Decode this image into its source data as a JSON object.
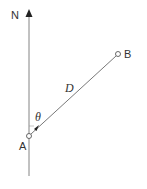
{
  "diagram": {
    "type": "bearing-diagram",
    "north_label": "N",
    "point_a_label": "A",
    "point_b_label": "B",
    "distance_label": "D",
    "angle_label": "θ",
    "colors": {
      "line": "#555555",
      "text": "#333333",
      "background": "#ffffff"
    },
    "points": {
      "A": {
        "x": 29,
        "y": 136
      },
      "B": {
        "x": 118,
        "y": 54
      }
    }
  }
}
